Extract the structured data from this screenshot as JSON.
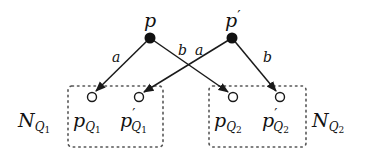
{
  "diagram": {
    "type": "bipartite-mapping",
    "colors": {
      "stroke": "#1a1a1a",
      "filled_node": "#111111",
      "open_node_fill": "#ffffff",
      "box": "#555555"
    },
    "source_nodes": [
      {
        "id": "p",
        "label": "p",
        "prime": "",
        "x": 150,
        "y": 38
      },
      {
        "id": "p_prime",
        "label": "p",
        "prime": "′",
        "x": 232,
        "y": 38
      }
    ],
    "target_nodes": [
      {
        "id": "pQ1",
        "label": "p",
        "prime": "",
        "sub": "Q",
        "subsub": "1",
        "x": 92,
        "y": 97
      },
      {
        "id": "p_primeQ1",
        "label": "p",
        "prime": "′",
        "sub": "Q",
        "subsub": "1",
        "x": 139,
        "y": 97
      },
      {
        "id": "pQ2",
        "label": "p",
        "prime": "",
        "sub": "Q",
        "subsub": "2",
        "x": 233,
        "y": 97
      },
      {
        "id": "p_primeQ2",
        "label": "p",
        "prime": "′",
        "sub": "Q",
        "subsub": "2",
        "x": 280,
        "y": 97
      }
    ],
    "edges": [
      {
        "from": "p",
        "to": "pQ1",
        "label": "a"
      },
      {
        "from": "p",
        "to": "pQ2",
        "label": "b"
      },
      {
        "from": "p_prime",
        "to": "p_primeQ1",
        "label": "a"
      },
      {
        "from": "p_prime",
        "to": "p_primeQ2",
        "label": "b"
      }
    ],
    "groups": [
      {
        "id": "NQ1",
        "label": "N",
        "sub": "Q",
        "subsub": "1",
        "members": [
          "pQ1",
          "p_primeQ1"
        ]
      },
      {
        "id": "NQ2",
        "label": "N",
        "sub": "Q",
        "subsub": "2",
        "members": [
          "pQ2",
          "p_primeQ2"
        ]
      }
    ]
  }
}
